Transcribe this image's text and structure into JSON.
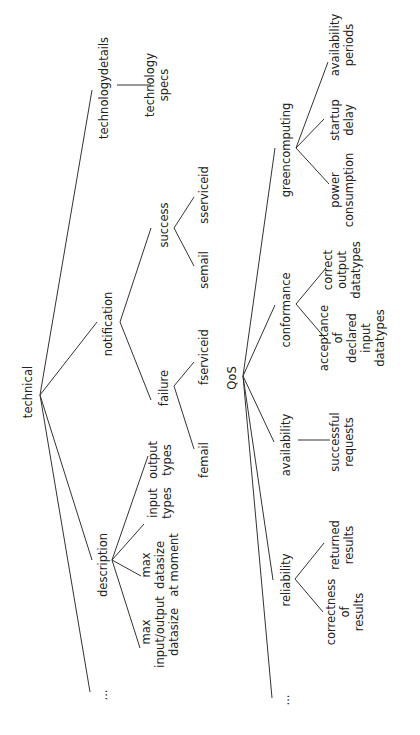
{
  "diagram": {
    "type": "tree",
    "orientation": "rotated-90-ccw",
    "colors": {
      "line": "#333333",
      "text": "#222222",
      "background": "#ffffff"
    },
    "trees": [
      {
        "root": "technical",
        "children": [
          {
            "label": "technologydetails",
            "children": [
              {
                "label": "technology specs"
              }
            ]
          },
          {
            "label": "notification",
            "children": [
              {
                "label": "success",
                "children": [
                  {
                    "label": "sserviceid"
                  },
                  {
                    "label": "semail"
                  }
                ]
              },
              {
                "label": "failure",
                "children": [
                  {
                    "label": "fserviceid"
                  },
                  {
                    "label": "femail"
                  }
                ]
              }
            ]
          },
          {
            "label": "description",
            "children": [
              {
                "label": "output types"
              },
              {
                "label": "input types"
              },
              {
                "label": "max datasize at moment"
              },
              {
                "label": "max input/output datasize"
              }
            ]
          },
          {
            "label": "..."
          }
        ]
      },
      {
        "root": "QoS",
        "children": [
          {
            "label": "greencomputing",
            "children": [
              {
                "label": "availability periods"
              },
              {
                "label": "startup delay"
              },
              {
                "label": "power consumption"
              }
            ]
          },
          {
            "label": "conformance",
            "children": [
              {
                "label": "correct output datatypes"
              },
              {
                "label": "acceptance of declared input datatypes"
              }
            ]
          },
          {
            "label": "availability",
            "children": [
              {
                "label": "successful requests"
              }
            ]
          },
          {
            "label": "reliability",
            "children": [
              {
                "label": "returned results"
              },
              {
                "label": "correctness of results"
              }
            ]
          },
          {
            "label": "..."
          }
        ]
      }
    ]
  },
  "nodes": {
    "technical": [
      "technical"
    ],
    "technologydetails": [
      "technologydetails"
    ],
    "technology_specs": [
      "technology",
      "specs"
    ],
    "notification": [
      "notification"
    ],
    "success": [
      "success"
    ],
    "failure": [
      "failure"
    ],
    "semail": [
      "semail"
    ],
    "sserviceid": [
      "sserviceid"
    ],
    "fserviceid": [
      "fserviceid"
    ],
    "femail": [
      "femail"
    ],
    "description": [
      "description"
    ],
    "output_types": [
      "output",
      "types"
    ],
    "input_types": [
      "input",
      "types"
    ],
    "max_datasize_at_moment": [
      "max",
      "datasize",
      "at moment"
    ],
    "max_io_datasize": [
      "max",
      "input/output",
      "datasize"
    ],
    "tech_ellipsis": [
      "..."
    ],
    "qos": [
      "QoS"
    ],
    "greencomputing": [
      "greencomputing"
    ],
    "availability_periods": [
      "availability",
      "periods"
    ],
    "startup_delay": [
      "startup",
      "delay"
    ],
    "power_consumption": [
      "power",
      "consumption"
    ],
    "conformance": [
      "conformance"
    ],
    "correct_output_datatypes": [
      "correct",
      "output",
      "datatypes"
    ],
    "acceptance_input_datatypes": [
      "acceptance",
      "of",
      "declared",
      "input",
      "datatypes"
    ],
    "availability": [
      "availability"
    ],
    "successful_requests": [
      "successful",
      "requests"
    ],
    "reliability": [
      "reliability"
    ],
    "returned_results": [
      "returned",
      "results"
    ],
    "correctness_of_results": [
      "correctness",
      "of",
      "results"
    ],
    "qos_ellipsis": [
      "..."
    ]
  }
}
